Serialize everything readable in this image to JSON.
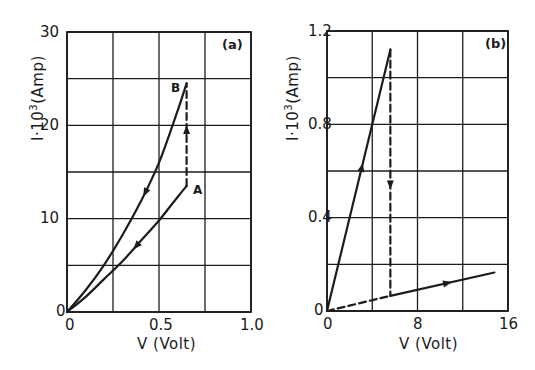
{
  "chart_data": [
    {
      "type": "line",
      "panel_label": "(a)",
      "title": "",
      "xlabel": "V (Volt)",
      "ylabel": "I·10^3 (Amp)",
      "ylabel_base": "I·10",
      "ylabel_exp": "3",
      "ylabel_unit": "(Amp)",
      "xlim": [
        0,
        1.0
      ],
      "ylim": [
        0,
        30
      ],
      "x_ticks": [
        "0",
        "0.5",
        "1.0"
      ],
      "y_ticks": [
        "0",
        "10",
        "20",
        "30"
      ],
      "grid": true,
      "grid_x_step": 0.25,
      "grid_y_step": 5,
      "point_labels": [
        "A",
        "B"
      ],
      "series": [
        {
          "name": "lower branch (0 to A)",
          "style": "solid",
          "arrow_direction": "toward origin",
          "x": [
            0,
            0.1,
            0.2,
            0.3,
            0.4,
            0.5,
            0.6,
            0.65
          ],
          "y": [
            0,
            1.6,
            3.5,
            5.4,
            7.6,
            9.8,
            12.3,
            13.5
          ]
        },
        {
          "name": "upper branch (0 to B)",
          "style": "solid",
          "arrow_direction": "toward origin",
          "x": [
            0,
            0.1,
            0.2,
            0.3,
            0.4,
            0.5,
            0.6,
            0.65
          ],
          "y": [
            0,
            2.3,
            5.0,
            8.2,
            11.8,
            16.0,
            21.5,
            24.5
          ]
        },
        {
          "name": "jump A to B",
          "style": "dashed",
          "arrow_direction": "up",
          "x": [
            0.65,
            0.65
          ],
          "y": [
            13.5,
            24.5
          ]
        }
      ]
    },
    {
      "type": "line",
      "panel_label": "(b)",
      "title": "",
      "xlabel": "V (Volt)",
      "ylabel": "I·10^3 (Amp)",
      "ylabel_base": "I·10",
      "ylabel_exp": "3",
      "ylabel_unit": "(Amp)",
      "xlim": [
        0,
        16
      ],
      "ylim": [
        0,
        1.2
      ],
      "x_ticks": [
        "0",
        "8",
        "16"
      ],
      "y_ticks": [
        "0",
        "0.4",
        "0.8",
        "1.2"
      ],
      "grid": true,
      "grid_x_step": 4,
      "grid_y_step": 0.2,
      "series": [
        {
          "name": "high-conductance branch",
          "style": "solid",
          "arrow_direction": "up",
          "x": [
            0,
            5.6
          ],
          "y": [
            0,
            1.12
          ]
        },
        {
          "name": "switch down",
          "style": "dashed",
          "arrow_direction": "down",
          "x": [
            5.6,
            5.6
          ],
          "y": [
            1.12,
            0.065
          ]
        },
        {
          "name": "low-conductance branch",
          "style": "solid",
          "arrow_direction": "right",
          "x": [
            5.6,
            14.8
          ],
          "y": [
            0.065,
            0.165
          ]
        },
        {
          "name": "low-conductance extrapolation",
          "style": "dashed",
          "arrow_direction": "none",
          "x": [
            0,
            5.6
          ],
          "y": [
            0,
            0.065
          ]
        }
      ]
    }
  ],
  "panels": {
    "a": {
      "tag": "(a)",
      "xticks": [
        "0",
        "0.5",
        "1.0"
      ],
      "yticks": [
        "0",
        "10",
        "20",
        "30"
      ],
      "xlabel": "V  (Volt)",
      "ylabel_base": "I·10",
      "ylabel_exp": "3",
      "ylabel_unit": "(Amp)",
      "point_a": "A",
      "point_b": "B"
    },
    "b": {
      "tag": "(b)",
      "xticks": [
        "0",
        "8",
        "16"
      ],
      "yticks": [
        "0",
        "0.4",
        "0.8",
        "1.2"
      ],
      "xlabel": "V  (Volt)",
      "ylabel_base": "I·10",
      "ylabel_exp": "3",
      "ylabel_unit": "(Amp)"
    }
  }
}
